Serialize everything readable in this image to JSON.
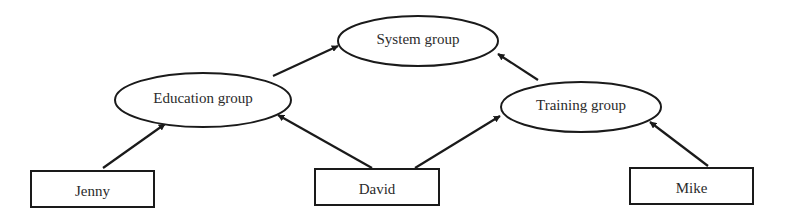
{
  "diagram": {
    "type": "hierarchy",
    "nodes": [
      {
        "id": "system",
        "label": "System group",
        "shape": "ellipse",
        "cx": 418,
        "cy": 41,
        "rx": 80,
        "ry": 25
      },
      {
        "id": "education",
        "label": "Education group",
        "shape": "ellipse",
        "cx": 203,
        "cy": 100,
        "rx": 88,
        "ry": 27
      },
      {
        "id": "training",
        "label": "Training group",
        "shape": "ellipse",
        "cx": 581,
        "cy": 107,
        "rx": 80,
        "ry": 25
      },
      {
        "id": "jenny",
        "label": "Jenny",
        "shape": "rect",
        "x": 31,
        "y": 171,
        "w": 123,
        "h": 36
      },
      {
        "id": "david",
        "label": "David",
        "shape": "rect",
        "x": 315,
        "y": 169,
        "w": 124,
        "h": 36
      },
      {
        "id": "mike",
        "label": "Mike",
        "shape": "rect",
        "x": 630,
        "y": 168,
        "w": 123,
        "h": 36
      }
    ],
    "edges": [
      {
        "from": "education",
        "to": "system",
        "x1": 273,
        "y1": 76,
        "x2": 338,
        "y2": 46
      },
      {
        "from": "training",
        "to": "system",
        "x1": 538,
        "y1": 80,
        "x2": 498,
        "y2": 54
      },
      {
        "from": "jenny",
        "to": "education",
        "x1": 103,
        "y1": 168,
        "x2": 165,
        "y2": 124
      },
      {
        "from": "david",
        "to": "education",
        "x1": 372,
        "y1": 168,
        "x2": 278,
        "y2": 115
      },
      {
        "from": "david",
        "to": "training",
        "x1": 415,
        "y1": 168,
        "x2": 500,
        "y2": 116
      },
      {
        "from": "mike",
        "to": "training",
        "x1": 708,
        "y1": 166,
        "x2": 650,
        "y2": 122
      }
    ]
  }
}
